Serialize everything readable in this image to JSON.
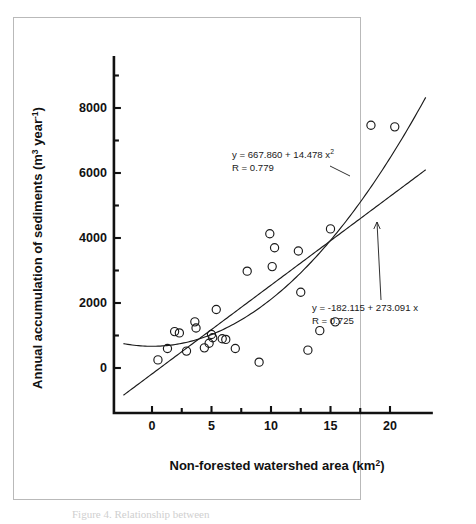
{
  "figure": {
    "frame_color": "#b9b9b9",
    "background": "#ffffff",
    "ink_color": "#1a1a1a",
    "caption_fragment": "Figure 4.  Relationship between"
  },
  "chart_data": {
    "type": "scatter",
    "title": "",
    "subtitle": "",
    "xlabel": "Non-forested watershed area  (km",
    "xlabel_sup": "2",
    "xlabel_tail": ")",
    "ylabel": "Annual accumulation of sediments  (m",
    "ylabel_sup1": "3",
    "ylabel_mid": " year",
    "ylabel_sup2": "-1",
    "ylabel_tail": ")",
    "xlim": [
      -3.2,
      23.6
    ],
    "ylim": [
      -1150,
      9600
    ],
    "xticks": [
      0,
      5,
      10,
      15,
      20
    ],
    "xtick_labels": [
      "0",
      "5",
      "10",
      "15",
      "20"
    ],
    "x_minor_ticks": [
      2.5,
      7.5,
      12.5,
      17.5
    ],
    "yticks": [
      0,
      2000,
      4000,
      6000,
      8000
    ],
    "ytick_labels": [
      "0",
      "2000",
      "4000",
      "6000",
      "8000"
    ],
    "y_minor_ticks": [
      1000,
      3000,
      5000,
      7000,
      9000
    ],
    "grid": false,
    "legend": "none",
    "marker_style": "open-circle",
    "points": [
      {
        "x": 0.5,
        "y": 250
      },
      {
        "x": 1.3,
        "y": 600
      },
      {
        "x": 1.9,
        "y": 1120
      },
      {
        "x": 2.3,
        "y": 1080
      },
      {
        "x": 2.9,
        "y": 520
      },
      {
        "x": 3.6,
        "y": 1420
      },
      {
        "x": 3.7,
        "y": 1230
      },
      {
        "x": 4.4,
        "y": 620
      },
      {
        "x": 4.8,
        "y": 760
      },
      {
        "x": 5.0,
        "y": 1030
      },
      {
        "x": 5.1,
        "y": 930
      },
      {
        "x": 5.4,
        "y": 1800
      },
      {
        "x": 5.9,
        "y": 900
      },
      {
        "x": 6.2,
        "y": 880
      },
      {
        "x": 7.0,
        "y": 600
      },
      {
        "x": 8.0,
        "y": 2980
      },
      {
        "x": 9.0,
        "y": 180
      },
      {
        "x": 9.9,
        "y": 4130
      },
      {
        "x": 10.1,
        "y": 3120
      },
      {
        "x": 10.3,
        "y": 3700
      },
      {
        "x": 12.3,
        "y": 3600
      },
      {
        "x": 12.5,
        "y": 2330
      },
      {
        "x": 13.1,
        "y": 550
      },
      {
        "x": 14.1,
        "y": 1150
      },
      {
        "x": 15.0,
        "y": 4280
      },
      {
        "x": 15.4,
        "y": 1420
      },
      {
        "x": 18.4,
        "y": 7470
      },
      {
        "x": 20.4,
        "y": 7420
      }
    ],
    "fits": [
      {
        "name": "quadratic-fit",
        "model": "quadratic",
        "equation": "y = 667.860 + 14.478 x",
        "equation_sup": "2",
        "r_label": "R = 0.779",
        "intercept": 667.86,
        "quadratic_coef": 14.478,
        "r": 0.779,
        "x_from": -2.4,
        "x_to": 23.0
      },
      {
        "name": "linear-fit",
        "model": "linear",
        "equation": "y = -182.115 + 273.091 x",
        "r_label": "R = 0.725",
        "intercept": -182.115,
        "slope": 273.091,
        "r": 0.725,
        "x_from": -2.4,
        "x_to": 23.0
      }
    ],
    "annotations": [
      {
        "name": "quadratic-annotation",
        "line1": "y = 667.860 + 14.478 x",
        "line1_sup": "2",
        "line2": "R = 0.779",
        "text_x": 232,
        "text_y": 158,
        "leader_from": [
          330,
          166
        ],
        "leader_to": [
          350,
          176
        ]
      },
      {
        "name": "linear-annotation",
        "line1": "y = -182.115 + 273.091 x",
        "line2": "R = 0.725",
        "text_x": 312,
        "text_y": 311,
        "leader_from": [
          381,
          300
        ],
        "leader_to": [
          377,
          222
        ]
      }
    ]
  }
}
